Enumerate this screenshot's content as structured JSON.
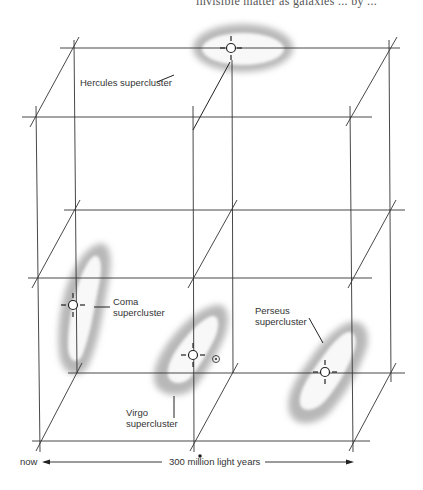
{
  "page": {
    "clipped_header_text": "invisible matter as galaxies ... by ..."
  },
  "diagram": {
    "grid": {
      "back_x": [
        74,
        232,
        391
      ],
      "back_y": [
        48,
        210,
        373
      ],
      "front_x": [
        37,
        193,
        353
      ],
      "front_y": [
        117,
        278,
        441
      ],
      "line_color": "#333333"
    },
    "clusters": [
      {
        "id": "hercules",
        "label_line1": "Hercules supercluster",
        "label_line2": "",
        "marker": [
          231,
          48
        ]
      },
      {
        "id": "coma",
        "label_line1": "Coma",
        "label_line2": "supercluster",
        "marker": [
          73,
          305
        ]
      },
      {
        "id": "virgo",
        "label_line1": "Virgo",
        "label_line2": "supercluster",
        "marker": [
          193,
          355
        ]
      },
      {
        "id": "perseus",
        "label_line1": "Perseus",
        "label_line2": "supercluster",
        "marker": [
          325,
          372
        ]
      }
    ],
    "sun_symbol": {
      "name": "sun-icon",
      "glyph": "⊙",
      "position": [
        216,
        359
      ]
    },
    "scale": {
      "left_label": "now",
      "center_label": "300 million light years"
    },
    "blob_color": "#bdbdbd"
  }
}
